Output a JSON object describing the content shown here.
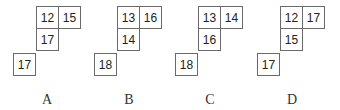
{
  "figures": [
    {
      "label": "A",
      "cells": {
        "top_left": "12",
        "top_right": "15",
        "middle": "17",
        "bottom_left": "17"
      }
    },
    {
      "label": "B",
      "cells": {
        "top_left": "13",
        "top_right": "16",
        "middle": "14",
        "bottom_left": "18"
      }
    },
    {
      "label": "C",
      "cells": {
        "top_left": "13",
        "top_right": "14",
        "middle": "16",
        "bottom_left": "18"
      }
    },
    {
      "label": "D",
      "cells": {
        "top_left": "12",
        "top_right": "17",
        "middle": "15",
        "bottom_left": "17"
      }
    }
  ]
}
